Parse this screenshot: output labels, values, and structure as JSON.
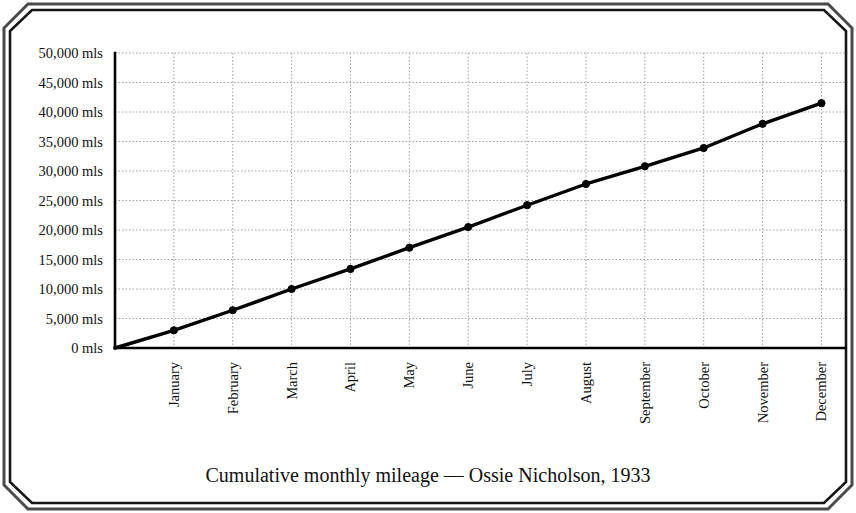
{
  "chart_data": {
    "type": "line",
    "title": "Cumulative monthly mileage — Ossie Nicholson, 1933",
    "xlabel": "",
    "ylabel": "",
    "categories": [
      "January",
      "February",
      "March",
      "April",
      "May",
      "June",
      "July",
      "August",
      "September",
      "October",
      "November",
      "December"
    ],
    "values": [
      3000,
      6400,
      10000,
      13400,
      17000,
      20500,
      24200,
      27800,
      30800,
      33900,
      38000,
      41500
    ],
    "series": [
      {
        "name": "Cumulative mileage",
        "values": [
          3000,
          6400,
          10000,
          13400,
          17000,
          20500,
          24200,
          27800,
          30800,
          33900,
          38000,
          41500
        ]
      }
    ],
    "origin_value": 0,
    "ylim": [
      0,
      50000
    ],
    "ytick_values": [
      0,
      5000,
      10000,
      15000,
      20000,
      25000,
      30000,
      35000,
      40000,
      45000,
      50000
    ],
    "ytick_labels": [
      "0 mls",
      "5,000 mls",
      "10,000 mls",
      "15,000 mls",
      "20,000 mls",
      "25,000 mls",
      "30,000 mls",
      "35,000 mls",
      "40,000 mls",
      "45,000 mls",
      "50,000 mls"
    ],
    "unit_suffix": "mls",
    "grid": true,
    "grid_style": "dotted",
    "legend": "none",
    "marker": "filled-circle",
    "line_color": "#000000",
    "grid_color": "#9a9a9a",
    "axis_color": "#000000",
    "background_color": "#ffffff",
    "xtick_rotation": -90
  },
  "frame": {
    "style": "octagonal-beveled-border",
    "outer_color": "#555555",
    "inner_color": "#111111"
  }
}
